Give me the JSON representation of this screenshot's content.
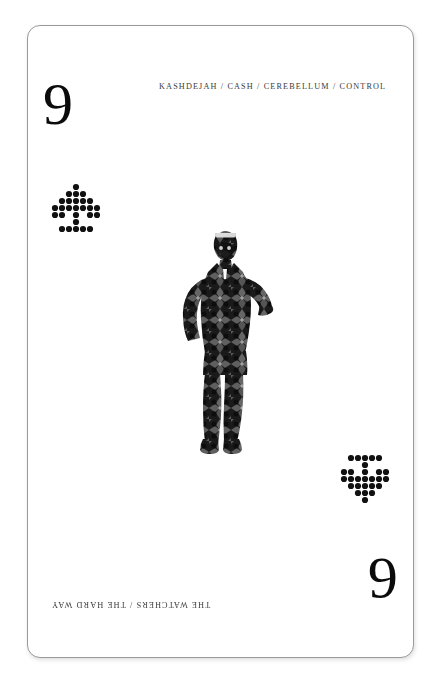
{
  "card": {
    "rank_top": "9",
    "rank_bottom": "6",
    "title_top": "KASHDEJAH / CASH / CEREBELLUM / CONTROL",
    "title_bottom": "THE WATCHERS / THE HARD WAY",
    "border_color": "#9a9a9a",
    "background_color": "#ffffff",
    "ink_color": "#0b0b0b",
    "text_color": "#3a3a3a"
  },
  "pips": {
    "icon_name": "halftone-arrow-pip",
    "dot_color": "#111111",
    "top_left_rotation": "0",
    "bottom_right_rotation": "180",
    "grid": [
      "...x...",
      "..xxx..",
      ".xxxxx.",
      "xxxxxxx",
      "xx.x.xx",
      "...x...",
      ".xxxxx."
    ]
  },
  "figure": {
    "icon_name": "patterned-standing-figure",
    "pose": "hands raised to face",
    "fill_pattern": "kaleidoscopic-damask",
    "silhouette_color": "#1a1a1a",
    "pattern_highlight": "#8d8d8d"
  }
}
